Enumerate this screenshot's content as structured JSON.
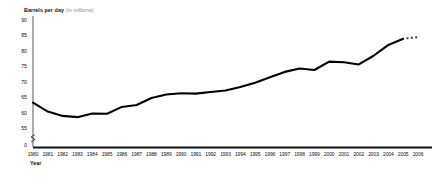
{
  "chart_data": {
    "type": "line",
    "title": "Barrels per day (in millions)",
    "title_main": "Barrels per day",
    "title_sub": "(in millions)",
    "xlabel": "Year",
    "ylabel": "Barrels per day (in millions)",
    "ylim": [
      55,
      90
    ],
    "yticks": [
      "90",
      "85",
      "80",
      "75",
      "70",
      "65",
      "60",
      "55",
      "0"
    ],
    "ytick_values": [
      90,
      85,
      80,
      75,
      70,
      65,
      60,
      55,
      0
    ],
    "axis_break": true,
    "grid": false,
    "legend": "none",
    "line_color": "#000000",
    "categories": [
      "1980",
      "1981",
      "1982",
      "1983",
      "1984",
      "1985",
      "1986",
      "1987",
      "1988",
      "1989",
      "1990",
      "1991",
      "1992",
      "1993",
      "1994",
      "1995",
      "1996",
      "1997",
      "1998",
      "1999",
      "2000",
      "2001",
      "2002",
      "2003",
      "2004",
      "2005",
      "2006"
    ],
    "xticks": [
      "1980",
      "1981",
      "1982",
      "1983",
      "1984",
      "1985",
      "1986",
      "1987",
      "1988",
      "1989",
      "1990",
      "1991",
      "1992",
      "1993",
      "1994",
      "1995",
      "1996",
      "1997",
      "1998",
      "1999",
      "2000",
      "2001",
      "2002",
      "2003",
      "2004",
      "2005",
      "2006"
    ],
    "series": [
      {
        "name": "World oil production",
        "style": "solid",
        "values": [
          63.2,
          60.3,
          58.9,
          58.5,
          59.7,
          59.6,
          61.8,
          62.4,
          64.7,
          65.8,
          66.2,
          66.1,
          66.6,
          67.1,
          68.2,
          69.6,
          71.4,
          73.1,
          74.2,
          73.7,
          76.4,
          76.2,
          75.5,
          78.3,
          81.8,
          83.8,
          84.3
        ]
      }
    ],
    "projection": {
      "style": "dotted",
      "from_category": "2005",
      "to_category": "2006",
      "marker_count": 3,
      "values": [
        84.0,
        84.2,
        84.3
      ]
    }
  }
}
